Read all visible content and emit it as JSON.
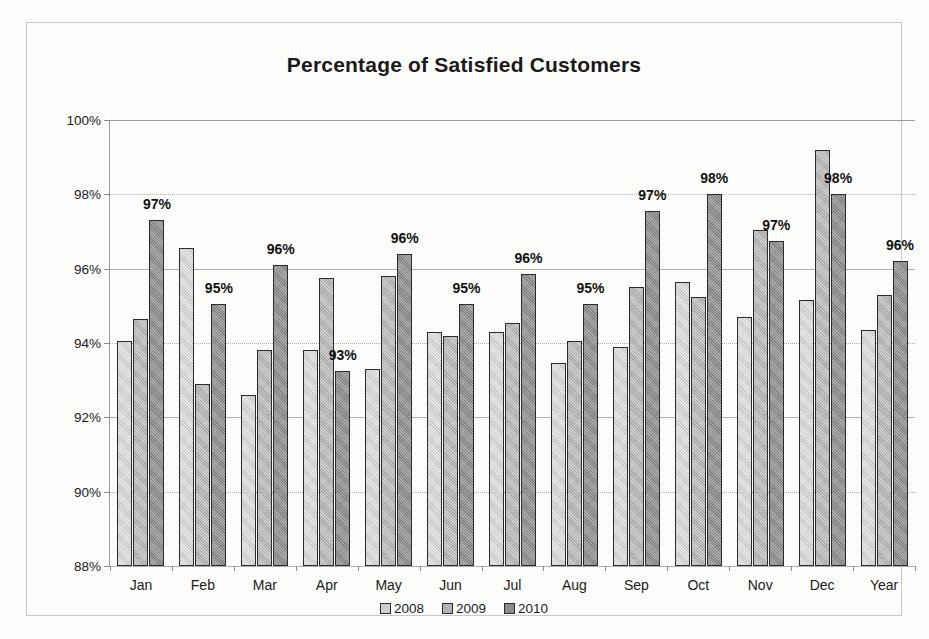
{
  "chart_data": {
    "type": "bar",
    "title": "Percentage of Satisfied Customers",
    "xlabel": "",
    "ylabel": "",
    "ylim": [
      88,
      100
    ],
    "ytick_step": 2,
    "ytick_labels": [
      "88%",
      "90%",
      "92%",
      "94%",
      "96%",
      "98%",
      "100%"
    ],
    "ytick_values": [
      88,
      90,
      92,
      94,
      96,
      98,
      100
    ],
    "grid": true,
    "legend_position": "bottom",
    "value_format": "percent",
    "categories": [
      "Jan",
      "Feb",
      "Mar",
      "Apr",
      "May",
      "Jun",
      "Jul",
      "Aug",
      "Sep",
      "Oct",
      "Nov",
      "Dec",
      "Year"
    ],
    "series": [
      {
        "name": "2008",
        "color": "#cfcfcf",
        "values": [
          94.05,
          96.55,
          92.6,
          93.8,
          93.3,
          94.3,
          94.3,
          93.45,
          93.9,
          95.65,
          94.7,
          95.15,
          94.35
        ]
      },
      {
        "name": "2009",
        "color": "#b2b2b2",
        "values": [
          94.65,
          92.9,
          93.8,
          95.75,
          95.8,
          94.2,
          94.55,
          94.05,
          95.5,
          95.25,
          97.05,
          99.2,
          95.3
        ]
      },
      {
        "name": "2010",
        "color": "#8c8c8c",
        "values": [
          97.3,
          95.05,
          96.1,
          93.25,
          96.4,
          95.05,
          95.85,
          95.05,
          97.55,
          98.0,
          96.75,
          98.0,
          96.2
        ]
      }
    ],
    "data_labels": {
      "series": "2010",
      "values": [
        "97%",
        "95%",
        "96%",
        "93%",
        "96%",
        "95%",
        "96%",
        "95%",
        "97%",
        "98%",
        "97%",
        "98%",
        "96%"
      ]
    }
  },
  "legend": {
    "items": [
      {
        "label": "2008"
      },
      {
        "label": "2009"
      },
      {
        "label": "2010"
      }
    ]
  }
}
